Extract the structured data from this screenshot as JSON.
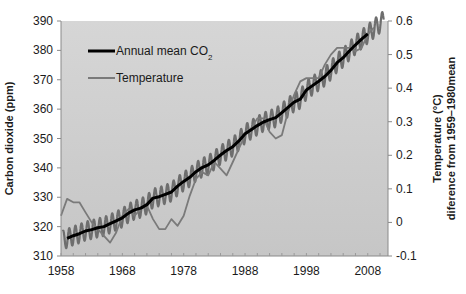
{
  "chart_data": {
    "type": "line",
    "title": "",
    "xlabel": "",
    "ylabel": "Carbon dioxide (ppm)",
    "ylabel_right": [
      "Temperature (°C)",
      "diference from 1959–1980mean"
    ],
    "xlim": [
      1958,
      2011.3
    ],
    "ylim": [
      310,
      390
    ],
    "ylim_right": [
      -0.1,
      0.6
    ],
    "x_ticks": [
      1958,
      1968,
      1978,
      1988,
      1998,
      2008
    ],
    "y_ticks": [
      310,
      320,
      330,
      340,
      350,
      360,
      370,
      380,
      390
    ],
    "y_ticks_right": [
      "-0.1",
      "0",
      "0.1",
      "0.2",
      "0.3",
      "0.4",
      "0.5",
      "0.6"
    ],
    "grid": false,
    "legend_position": "upper left",
    "legend": [
      {
        "label": "Annual mean CO",
        "subscript": "2",
        "color": "#000000"
      },
      {
        "label": "Temperature",
        "color": "#7a7a7a"
      }
    ],
    "series": [
      {
        "name": "Annual mean CO2",
        "axis": "left",
        "color": "#000000",
        "x": [
          1959,
          1960,
          1961,
          1962,
          1963,
          1964,
          1965,
          1966,
          1967,
          1968,
          1969,
          1970,
          1971,
          1972,
          1973,
          1974,
          1975,
          1976,
          1977,
          1978,
          1979,
          1980,
          1981,
          1982,
          1983,
          1984,
          1985,
          1986,
          1987,
          1988,
          1989,
          1990,
          1991,
          1992,
          1993,
          1994,
          1995,
          1996,
          1997,
          1998,
          1999,
          2000,
          2001,
          2002,
          2003,
          2004,
          2005,
          2006,
          2007,
          2008
        ],
        "values": [
          316,
          316.9,
          317.6,
          318.5,
          319,
          319.6,
          320,
          321,
          322,
          323,
          324.6,
          325.7,
          326.3,
          327.5,
          329.7,
          330.2,
          331,
          331.8,
          333.8,
          335.4,
          336.8,
          338.7,
          340.1,
          341,
          342.6,
          344.4,
          345.9,
          347.2,
          349.2,
          351.6,
          353,
          354.4,
          355.6,
          356.4,
          357.1,
          358.8,
          360.6,
          362.4,
          363.4,
          366.5,
          368,
          369.5,
          371.1,
          373.2,
          375.8,
          377.5,
          379.8,
          381.9,
          383.8,
          385.6
        ]
      },
      {
        "name": "Monthly CO2 (seasonal cycle)",
        "axis": "left",
        "color": "#6e6e6e",
        "amplitude_ppm": 3.2,
        "x_range": [
          1958.3,
          2010.6
        ]
      },
      {
        "name": "Temperature",
        "axis": "right",
        "color": "#7a7a7a",
        "x": [
          1958,
          1959,
          1960,
          1961,
          1962,
          1963,
          1964,
          1965,
          1966,
          1967,
          1968,
          1969,
          1970,
          1971,
          1972,
          1973,
          1974,
          1975,
          1976,
          1977,
          1978,
          1979,
          1980,
          1981,
          1982,
          1983,
          1984,
          1985,
          1986,
          1987,
          1988,
          1989,
          1990,
          1991,
          1992,
          1993,
          1994,
          1995,
          1996,
          1997,
          1998,
          1999,
          2000,
          2001,
          2002,
          2003,
          2004,
          2005,
          2006,
          2007,
          2008,
          2009
        ],
        "values": [
          0.02,
          0.07,
          0.06,
          0.06,
          0.03,
          0.0,
          -0.02,
          -0.04,
          -0.06,
          -0.03,
          0.02,
          0.04,
          0.02,
          0.04,
          0.05,
          0.01,
          -0.02,
          -0.02,
          0.01,
          -0.01,
          0.02,
          0.08,
          0.13,
          0.15,
          0.14,
          0.18,
          0.16,
          0.14,
          0.18,
          0.22,
          0.26,
          0.28,
          0.31,
          0.31,
          0.27,
          0.25,
          0.26,
          0.33,
          0.38,
          0.42,
          0.43,
          0.43,
          0.43,
          0.47,
          0.5,
          0.52,
          0.52,
          0.52,
          0.51,
          0.52,
          0.56,
          0.58
        ]
      }
    ]
  },
  "layout": {
    "plot": {
      "left": 61,
      "top": 21,
      "right": 388,
      "bottom": 256
    },
    "plot_bg": "#c8c8c8",
    "plot_bg_top": "#d4d4d4"
  }
}
